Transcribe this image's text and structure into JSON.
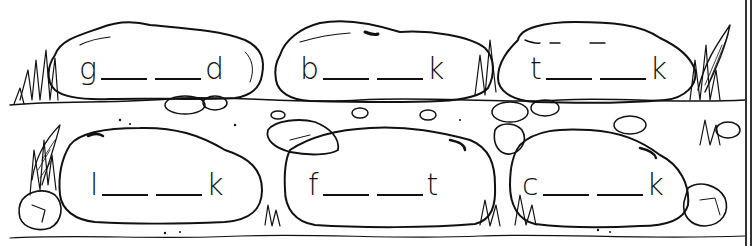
{
  "worksheet": {
    "type": "phonics fill-in-the-blank",
    "rows": [
      {
        "words": [
          {
            "first": "g",
            "blanks": 2,
            "last": "d"
          },
          {
            "first": "b",
            "blanks": 2,
            "last": "k"
          },
          {
            "first": "t",
            "blanks": 2,
            "last": "k"
          }
        ]
      },
      {
        "words": [
          {
            "first": "l",
            "blanks": 2,
            "last": "k"
          },
          {
            "first": "f",
            "blanks": 2,
            "last": "t"
          },
          {
            "first": "c",
            "blanks": 2,
            "last": "k"
          }
        ]
      }
    ]
  },
  "colors": {
    "ink": "#111111",
    "paper": "#ffffff"
  },
  "icons": [
    "rock-icon",
    "grass-icon",
    "pebble-icon",
    "fern-icon"
  ]
}
